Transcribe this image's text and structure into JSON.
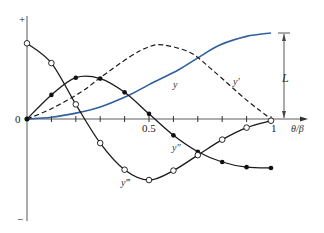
{
  "chart_data": {
    "type": "line",
    "title": "",
    "xlabel": "θ/β",
    "ylabel": "",
    "x_ticks": [
      0,
      0.1,
      0.2,
      0.3,
      0.4,
      0.5,
      0.6,
      0.7,
      0.8,
      0.9,
      1.0
    ],
    "x_tick_labels": {
      "origin": "0",
      "mid": "0.5",
      "end": "1"
    },
    "y_axis_labels": {
      "top": "+",
      "bottom": "−"
    },
    "xlim": [
      0,
      1
    ],
    "grid": false,
    "dimension_label": "L",
    "series": [
      {
        "name": "y",
        "style": "solid-blue",
        "color": "#2f5f9e",
        "x": [
          0,
          0.1,
          0.22,
          0.3,
          0.42,
          0.5,
          0.62,
          0.7,
          0.79,
          0.9,
          1.0
        ],
        "values": [
          0,
          0.02,
          0.08,
          0.14,
          0.28,
          0.4,
          0.57,
          0.71,
          0.86,
          0.96,
          1.0
        ]
      },
      {
        "name": "y'",
        "style": "dashed",
        "color": "#1a1a1a",
        "x": [
          0,
          0.1,
          0.22,
          0.3,
          0.42,
          0.5,
          0.56,
          0.67,
          0.76,
          0.9,
          1.0
        ],
        "values": [
          0,
          0.12,
          0.31,
          0.48,
          0.72,
          0.84,
          0.86,
          0.77,
          0.57,
          0.22,
          0
        ]
      },
      {
        "name": "y''",
        "style": "solid-filled-dots",
        "color": "#1a1a1a",
        "x": [
          0,
          0.1,
          0.2,
          0.3,
          0.4,
          0.5,
          0.6,
          0.7,
          0.8,
          0.9,
          1.0
        ],
        "values": [
          0,
          0.28,
          0.48,
          0.47,
          0.31,
          0.06,
          -0.19,
          -0.38,
          -0.5,
          -0.56,
          -0.57
        ]
      },
      {
        "name": "y'''",
        "style": "solid-open-circles",
        "color": "#1a1a1a",
        "x": [
          0,
          0.1,
          0.2,
          0.3,
          0.4,
          0.5,
          0.6,
          0.7,
          0.8,
          0.9,
          1.0
        ],
        "values": [
          0.88,
          0.65,
          0.17,
          -0.28,
          -0.59,
          -0.71,
          -0.6,
          -0.42,
          -0.24,
          -0.1,
          -0.02
        ]
      }
    ],
    "legend": "inline labels on curves"
  },
  "labels": {
    "plus": "+",
    "minus": "−",
    "origin": "0",
    "half": "0.5",
    "one": "1",
    "xaxis": "θ/β",
    "L": "L",
    "y": "y",
    "yp": "y′",
    "ypp": "y″",
    "yppp": "y‴"
  }
}
